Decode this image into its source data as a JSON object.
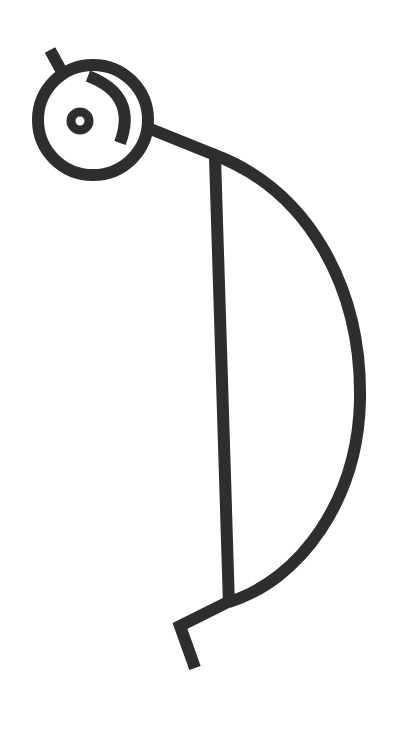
{
  "figure": {
    "stroke_color": "#2e2e2e",
    "background": "#ffffff"
  }
}
